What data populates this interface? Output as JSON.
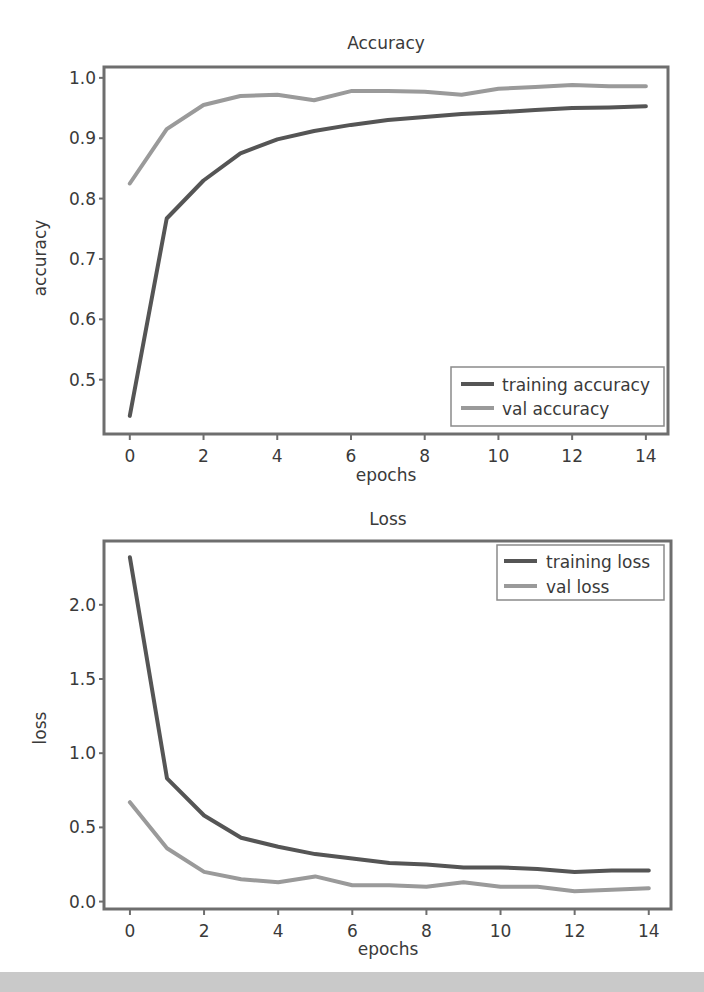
{
  "chart_data": [
    {
      "type": "line",
      "title": "Accuracy",
      "xlabel": "epochs",
      "ylabel": "accuracy",
      "x": [
        0,
        1,
        2,
        3,
        4,
        5,
        6,
        7,
        8,
        9,
        10,
        11,
        12,
        13,
        14
      ],
      "xticks": [
        0,
        2,
        4,
        6,
        8,
        10,
        12,
        14
      ],
      "yticks": [
        0.5,
        0.6,
        0.7,
        0.8,
        0.9,
        1.0
      ],
      "ytick_labels": [
        "0.5",
        "0.6",
        "0.7",
        "0.8",
        "0.9",
        "1.0"
      ],
      "xlim": [
        -0.7,
        14.6
      ],
      "ylim": [
        0.41,
        1.018
      ],
      "grid": false,
      "legend_position": "lower right",
      "series": [
        {
          "name": "training accuracy",
          "color": "#555555",
          "values": [
            0.44,
            0.767,
            0.83,
            0.875,
            0.898,
            0.912,
            0.922,
            0.93,
            0.935,
            0.94,
            0.943,
            0.947,
            0.95,
            0.951,
            0.953
          ]
        },
        {
          "name": "val accuracy",
          "color": "#9a9a9a",
          "values": [
            0.825,
            0.915,
            0.955,
            0.97,
            0.972,
            0.963,
            0.978,
            0.978,
            0.977,
            0.972,
            0.982,
            0.985,
            0.988,
            0.986,
            0.986
          ]
        }
      ]
    },
    {
      "type": "line",
      "title": "Loss",
      "xlabel": "epochs",
      "ylabel": "loss",
      "x": [
        0,
        1,
        2,
        3,
        4,
        5,
        6,
        7,
        8,
        9,
        10,
        11,
        12,
        13,
        14
      ],
      "xticks": [
        0,
        2,
        4,
        6,
        8,
        10,
        12,
        14
      ],
      "yticks": [
        0.0,
        0.5,
        1.0,
        1.5,
        2.0
      ],
      "ytick_labels": [
        "0.0",
        "0.5",
        "1.0",
        "1.5",
        "2.0"
      ],
      "xlim": [
        -0.7,
        14.6
      ],
      "ylim": [
        -0.05,
        2.43
      ],
      "grid": false,
      "legend_position": "upper right",
      "series": [
        {
          "name": "training loss",
          "color": "#555555",
          "values": [
            2.32,
            0.83,
            0.58,
            0.43,
            0.37,
            0.32,
            0.29,
            0.26,
            0.25,
            0.23,
            0.23,
            0.22,
            0.2,
            0.21,
            0.21
          ]
        },
        {
          "name": "val loss",
          "color": "#9a9a9a",
          "values": [
            0.67,
            0.36,
            0.2,
            0.15,
            0.13,
            0.17,
            0.11,
            0.11,
            0.1,
            0.13,
            0.1,
            0.1,
            0.07,
            0.08,
            0.09
          ]
        }
      ]
    }
  ]
}
